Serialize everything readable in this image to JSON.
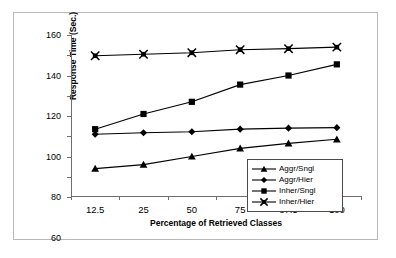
{
  "chart_data": {
    "type": "line",
    "title": "",
    "xlabel": "Percentage of Retrieved Classes",
    "ylabel": "Response Time (Sec.)",
    "categories": [
      "12.5",
      "25",
      "50",
      "75",
      "87.5",
      "100"
    ],
    "ylim": [
      0,
      160
    ],
    "ytick_labels": [
      "0",
      "20",
      "40",
      "60",
      "80",
      "100",
      "120",
      "140",
      "160"
    ],
    "yticks": [
      0,
      20,
      40,
      60,
      80,
      100,
      120,
      140,
      160
    ],
    "grid": false,
    "legend_position": "lower-right",
    "series": [
      {
        "name": "Aggr/Sngl",
        "marker": "triangle-icon",
        "color": "#000000",
        "values": [
          28,
          32,
          40,
          48,
          53,
          57
        ]
      },
      {
        "name": "Aggr/Hier",
        "marker": "diamond-icon",
        "color": "#000000",
        "values": [
          62,
          63.5,
          64.5,
          67,
          68,
          68.5
        ]
      },
      {
        "name": "Inher/Sngl",
        "marker": "square-icon",
        "color": "#000000",
        "values": [
          67,
          82,
          94,
          111,
          120,
          131
        ]
      },
      {
        "name": "Inher/Hier",
        "marker": "star-x-icon",
        "color": "#000000",
        "values": [
          139.5,
          141,
          142.5,
          145.5,
          146.5,
          148
        ]
      }
    ]
  }
}
